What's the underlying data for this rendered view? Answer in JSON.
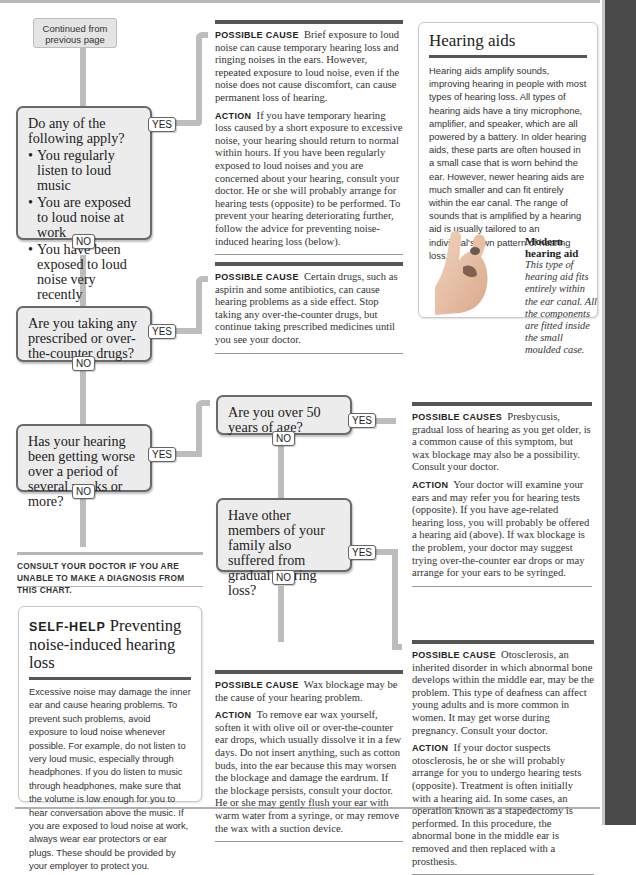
{
  "page": {
    "continued_label": "Continued from previous page",
    "consult_note": "Consult your doctor if you are unable to make a diagnosis from this chart."
  },
  "flowchart": {
    "yes_label": "YES",
    "no_label": "NO",
    "questions": [
      {
        "text": "Do any of the following apply?",
        "bullets": [
          "You regularly listen to loud music",
          "You are exposed to loud noise at work",
          "You have been exposed to loud noise very recently"
        ]
      },
      {
        "text": "Are you taking any prescribed or over-the-counter drugs?"
      },
      {
        "text": "Has your hearing been getting worse over a period of several weeks or more?"
      },
      {
        "text": "Are you over 50 years of age?"
      },
      {
        "text": "Have other members of your family also suffered from gradual hearing loss?"
      }
    ]
  },
  "outcomes": [
    {
      "cause_label": "Possible cause",
      "cause_text": "Brief exposure to loud noise can cause temporary hearing loss and ringing noises in the ears. However, repeated exposure to loud noise, even if the noise does not cause discomfort, can cause permanent loss of hearing.",
      "action_label": "Action",
      "action_text": "If you have temporary hearing loss caused by a short exposure to excessive noise, your hearing should return to normal within hours. If you have been regularly exposed to loud noises and you are concerned about your hearing, consult your doctor. He or she will probably arrange for hearing tests (opposite) to be performed. To prevent your hearing deteriorating further, follow the advice for preventing noise-induced hearing loss (below)."
    },
    {
      "cause_label": "Possible cause",
      "cause_text": "Certain drugs, such as aspirin and some antibiotics, can cause hearing problems as a side effect. Stop taking any over-the-counter drugs, but continue taking prescribed medicines until you see your doctor."
    },
    {
      "cause_label": "Possible causes",
      "cause_text": "Presbycusis, gradual loss of hearing as you get older, is a common cause of this symptom, but wax blockage may also be a possibility. Consult your doctor.",
      "action_label": "Action",
      "action_text": "Your doctor will examine your ears and may refer you for hearing tests (opposite). If you have age-related hearing loss, you will probably be offered a hearing aid (above). If wax blockage is the problem, your doctor may suggest trying over-the-counter ear drops or may arrange for your ears to be syringed."
    },
    {
      "cause_label": "Possible cause",
      "cause_text": "Wax blockage may be the cause of your hearing problem.",
      "action_label": "Action",
      "action_text": "To remove ear wax yourself, soften it with olive oil or over-the-counter ear drops, which usually dissolve it in a few days. Do not insert anything, such as cotton buds, into the ear because this may worsen the blockage and damage the eardrum. If the blockage persists, consult your doctor. He or she may gently flush your ear with warm water from a syringe, or may remove the wax with a suction device."
    },
    {
      "cause_label": "Possible cause",
      "cause_text": "Otosclerosis, an inherited disorder in which abnormal bone develops within the middle ear, may be the problem. This type of deafness can affect young adults and is more common in women. It may get worse during pregnancy. Consult your doctor.",
      "action_label": "Action",
      "action_text": "If your doctor suspects otosclerosis, he or she will probably arrange for you to undergo hearing tests (opposite). Treatment is often initially with a hearing aid. In some cases, an operation known as a stapedectomy is performed. In this procedure, the abnormal bone in the middle ear is removed and then replaced with a prosthesis."
    }
  ],
  "hearing_aids_box": {
    "title": "Hearing aids",
    "body": "Hearing aids amplify sounds, improving hearing in people with most types of hearing loss. All types of hearing aids have a tiny microphone, amplifier, and speaker, which are all powered by a battery. In older hearing aids, these parts are often housed in a small case that is worn behind the ear. However, newer hearing aids are much smaller and can fit entirely within the ear canal. The range of sounds that is amplified by a hearing aid is usually tailored to an individual's own pattern of hearing loss.",
    "caption_title": "Modern hearing aid",
    "caption_text": "This type of hearing aid fits entirely within the ear canal. All the components are fitted inside the small moulded case."
  },
  "self_help_box": {
    "label": "Self-help",
    "title": "Preventing noise-induced hearing loss",
    "body": "Excessive noise may damage the inner ear and cause hearing problems. To prevent such problems, avoid exposure to loud noise whenever possible. For example, do not listen to very loud music, especially through headphones. If you do listen to music through headphones, make sure that the volume is low enough for you to hear conversation above the music. If you are exposed to loud noise at work, always wear ear protectors or ear plugs. These should be provided by your employer to protect you."
  },
  "colors": {
    "pipe": "#bdbdbd",
    "question_fill": "#ececec",
    "question_border": "#6a6a6a",
    "sidebar": "#4a4a4a",
    "rule_dark": "#555555"
  }
}
